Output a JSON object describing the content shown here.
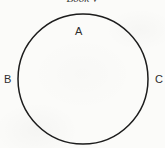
{
  "figure": {
    "title": "Book V",
    "background_color": "#fbfbf9",
    "stroke_color": "#1c1c1c",
    "label_color": "#2e2e2e",
    "title_color": "#3a3a3a",
    "shape": {
      "type": "circle",
      "center_x": 83,
      "center_y": 79,
      "radius": 65,
      "stroke_width": 1.5,
      "fill": "none"
    },
    "labels": [
      {
        "id": "A",
        "text": "A",
        "position": "inside-top",
        "x": 80,
        "y": 32
      },
      {
        "id": "B",
        "text": "B",
        "position": "outside-left",
        "x": 6,
        "y": 80
      },
      {
        "id": "C",
        "text": "C",
        "position": "outside-right",
        "x": 158,
        "y": 80
      }
    ]
  }
}
